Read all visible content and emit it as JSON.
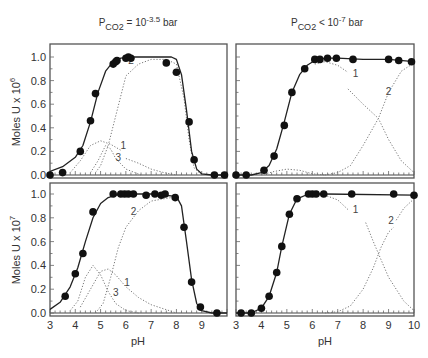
{
  "chart_data": {
    "type": "scatter",
    "titles": {
      "left": {
        "base": "P",
        "sub": "CO2",
        "rest": " = 10",
        "sup": "-3.5",
        "unit": " bar"
      },
      "right": {
        "base": "P",
        "sub": "CO2",
        "rest": " < 10",
        "sup": "-7",
        "unit": " bar"
      }
    },
    "xlabel": "pH",
    "xlim": [
      3,
      10
    ],
    "xticks": [
      3,
      4,
      5,
      6,
      7,
      8,
      9,
      10
    ],
    "ylabels": {
      "top": {
        "text": "Moles U x 10",
        "sup": "6"
      },
      "bottom": {
        "text": "Moles U x 10",
        "sup": "7"
      }
    },
    "ylim": [
      0,
      1.1
    ],
    "yticks": [
      0.0,
      0.2,
      0.4,
      0.6,
      0.8,
      1.0
    ],
    "panels": [
      {
        "id": "top-left",
        "column": "left",
        "row": "top",
        "points": [
          [
            3.0,
            0.0
          ],
          [
            3.5,
            0.02
          ],
          [
            4.2,
            0.2
          ],
          [
            4.6,
            0.46
          ],
          [
            4.8,
            0.69
          ],
          [
            5.5,
            0.94
          ],
          [
            5.6,
            0.96
          ],
          [
            5.65,
            0.97
          ],
          [
            6.0,
            0.99
          ],
          [
            6.1,
            1.0
          ],
          [
            6.2,
            0.99
          ],
          [
            7.6,
            0.95
          ],
          [
            8.0,
            0.87
          ],
          [
            8.5,
            0.45
          ],
          [
            8.7,
            0.13
          ],
          [
            9.5,
            0.0
          ],
          [
            9.9,
            0.0
          ]
        ],
        "fit": [
          [
            3.0,
            0.03
          ],
          [
            3.5,
            0.07
          ],
          [
            4.0,
            0.15
          ],
          [
            4.3,
            0.25
          ],
          [
            4.6,
            0.45
          ],
          [
            4.9,
            0.7
          ],
          [
            5.2,
            0.88
          ],
          [
            5.5,
            0.96
          ],
          [
            5.8,
            0.99
          ],
          [
            6.2,
            1.0
          ],
          [
            7.0,
            1.0
          ],
          [
            7.8,
            1.0
          ],
          [
            8.0,
            0.98
          ],
          [
            8.2,
            0.85
          ],
          [
            8.4,
            0.55
          ],
          [
            8.6,
            0.2
          ],
          [
            8.8,
            0.05
          ],
          [
            9.0,
            0.01
          ],
          [
            9.4,
            0.0
          ],
          [
            10.0,
            0.0
          ]
        ],
        "species": [
          {
            "label": "1",
            "label_at": [
              5.9,
              0.22
            ],
            "points": [
              [
                3.8,
                0.02
              ],
              [
                4.2,
                0.12
              ],
              [
                4.6,
                0.25
              ],
              [
                5.0,
                0.29
              ],
              [
                5.4,
                0.26
              ],
              [
                5.8,
                0.21
              ]
            ]
          },
          {
            "label": "2",
            "label_at": [
              6.2,
              0.94
            ],
            "points": [
              [
                4.8,
                0.02
              ],
              [
                5.0,
                0.08
              ],
              [
                5.3,
                0.25
              ],
              [
                5.6,
                0.5
              ],
              [
                6.0,
                0.84
              ],
              [
                6.5,
                0.94
              ],
              [
                7.0,
                0.98
              ],
              [
                7.6,
                0.98
              ],
              [
                8.0,
                0.94
              ],
              [
                8.3,
                0.65
              ],
              [
                8.5,
                0.3
              ],
              [
                8.7,
                0.06
              ],
              [
                9.0,
                0.0
              ]
            ]
          },
          {
            "label": "3",
            "label_at": [
              5.7,
              0.12
            ],
            "points": [
              [
                4.6,
                0.02
              ],
              [
                4.9,
                0.12
              ],
              [
                5.2,
                0.25
              ],
              [
                5.4,
                0.22
              ],
              [
                5.6,
                0.14
              ],
              [
                6.0,
                0.05
              ],
              [
                6.6,
                0.0
              ]
            ]
          },
          {
            "label": "",
            "label_at": null,
            "points": [
              [
                6.0,
                0.14
              ],
              [
                6.5,
                0.1
              ],
              [
                7.0,
                0.05
              ],
              [
                7.5,
                0.02
              ],
              [
                8.0,
                0.0
              ]
            ]
          }
        ]
      },
      {
        "id": "top-right",
        "column": "right",
        "row": "top",
        "points": [
          [
            3.0,
            0.0
          ],
          [
            3.4,
            0.0
          ],
          [
            4.1,
            0.04
          ],
          [
            4.5,
            0.16
          ],
          [
            4.9,
            0.42
          ],
          [
            5.2,
            0.7
          ],
          [
            5.7,
            0.9
          ],
          [
            6.1,
            0.98
          ],
          [
            6.3,
            0.98
          ],
          [
            6.6,
            0.99
          ],
          [
            6.95,
            0.99
          ],
          [
            7.6,
            0.98
          ],
          [
            9.0,
            0.98
          ],
          [
            9.4,
            0.97
          ],
          [
            9.9,
            0.96
          ]
        ],
        "fit": [
          [
            3.0,
            0.0
          ],
          [
            3.6,
            0.0
          ],
          [
            4.0,
            0.02
          ],
          [
            4.3,
            0.08
          ],
          [
            4.6,
            0.22
          ],
          [
            4.9,
            0.45
          ],
          [
            5.2,
            0.7
          ],
          [
            5.5,
            0.85
          ],
          [
            5.8,
            0.93
          ],
          [
            6.1,
            0.97
          ],
          [
            6.5,
            0.99
          ],
          [
            7.0,
            0.99
          ],
          [
            8.0,
            0.98
          ],
          [
            9.0,
            0.98
          ],
          [
            10.0,
            0.96
          ]
        ],
        "species": [
          {
            "label": "1",
            "label_at": [
              7.7,
              0.83
            ],
            "points": [
              [
                6.1,
                0.94
              ],
              [
                6.5,
                0.96
              ],
              [
                7.0,
                0.93
              ],
              [
                7.4,
                0.87
              ]
            ]
          },
          {
            "label": "",
            "label_at": null,
            "points": [
              [
                4.0,
                0.0
              ],
              [
                4.5,
                0.03
              ],
              [
                5.0,
                0.05
              ],
              [
                5.5,
                0.04
              ],
              [
                6.0,
                0.01
              ],
              [
                6.5,
                0.0
              ]
            ]
          },
          {
            "label": "",
            "label_at": null,
            "points": [
              [
                7.4,
                0.73
              ],
              [
                8.0,
                0.6
              ],
              [
                8.6,
                0.48
              ],
              [
                9.0,
                0.3
              ],
              [
                9.5,
                0.12
              ],
              [
                10.0,
                0.02
              ]
            ]
          },
          {
            "label": "2",
            "label_at": [
              9.0,
              0.68
            ],
            "points": [
              [
                6.5,
                0.0
              ],
              [
                7.0,
                0.02
              ],
              [
                7.5,
                0.08
              ],
              [
                8.0,
                0.25
              ],
              [
                8.6,
                0.48
              ],
              [
                9.0,
                0.7
              ],
              [
                9.5,
                0.88
              ],
              [
                10.0,
                0.95
              ]
            ]
          }
        ]
      },
      {
        "id": "bottom-left",
        "column": "left",
        "row": "bottom",
        "points": [
          [
            3.6,
            0.14
          ],
          [
            4.0,
            0.33
          ],
          [
            4.3,
            0.5
          ],
          [
            4.7,
            0.85
          ],
          [
            5.5,
            1.0
          ],
          [
            5.8,
            1.0
          ],
          [
            5.95,
            1.0
          ],
          [
            6.1,
            1.0
          ],
          [
            6.3,
            1.0
          ],
          [
            6.8,
            0.99
          ],
          [
            7.15,
            1.0
          ],
          [
            7.4,
            0.99
          ],
          [
            7.55,
            1.0
          ],
          [
            7.95,
            0.97
          ],
          [
            8.3,
            0.72
          ],
          [
            8.6,
            0.26
          ],
          [
            8.95,
            0.05
          ],
          [
            9.6,
            0.0
          ]
        ],
        "fit": [
          [
            3.0,
            0.03
          ],
          [
            3.4,
            0.09
          ],
          [
            3.8,
            0.22
          ],
          [
            4.1,
            0.38
          ],
          [
            4.4,
            0.6
          ],
          [
            4.7,
            0.8
          ],
          [
            5.0,
            0.92
          ],
          [
            5.3,
            0.97
          ],
          [
            5.6,
            0.99
          ],
          [
            6.0,
            1.0
          ],
          [
            7.0,
            1.0
          ],
          [
            8.0,
            0.98
          ],
          [
            8.2,
            0.9
          ],
          [
            8.4,
            0.6
          ],
          [
            8.6,
            0.28
          ],
          [
            8.8,
            0.08
          ],
          [
            9.0,
            0.02
          ],
          [
            9.4,
            0.0
          ],
          [
            10.0,
            0.0
          ]
        ],
        "species": [
          {
            "label": "1",
            "label_at": [
              6.05,
              0.23
            ],
            "points": [
              [
                4.2,
                0.05
              ],
              [
                4.6,
                0.2
              ],
              [
                5.0,
                0.35
              ],
              [
                5.3,
                0.37
              ],
              [
                5.6,
                0.32
              ],
              [
                6.0,
                0.22
              ],
              [
                6.5,
                0.13
              ],
              [
                7.0,
                0.07
              ],
              [
                8.0,
                0.0
              ]
            ]
          },
          {
            "label": "2",
            "label_at": [
              6.3,
              0.82
            ],
            "points": [
              [
                4.8,
                0.0
              ],
              [
                5.1,
                0.08
              ],
              [
                5.4,
                0.3
              ],
              [
                5.7,
                0.55
              ],
              [
                6.0,
                0.72
              ],
              [
                6.5,
                0.86
              ],
              [
                7.0,
                0.94
              ],
              [
                7.5,
                0.96
              ],
              [
                7.8,
                0.97
              ]
            ]
          },
          {
            "label": "3",
            "label_at": [
              5.6,
              0.14
            ],
            "points": [
              [
                3.8,
                0.02
              ],
              [
                4.1,
                0.1
              ],
              [
                4.4,
                0.3
              ],
              [
                4.7,
                0.4
              ],
              [
                5.0,
                0.32
              ],
              [
                5.3,
                0.18
              ],
              [
                5.6,
                0.08
              ],
              [
                6.0,
                0.02
              ],
              [
                6.5,
                0.0
              ]
            ]
          }
        ]
      },
      {
        "id": "bottom-right",
        "column": "right",
        "row": "bottom",
        "points": [
          [
            3.2,
            0.0
          ],
          [
            3.6,
            0.0
          ],
          [
            4.0,
            0.04
          ],
          [
            4.3,
            0.14
          ],
          [
            4.6,
            0.34
          ],
          [
            4.8,
            0.56
          ],
          [
            5.1,
            0.83
          ],
          [
            5.4,
            0.96
          ],
          [
            5.85,
            1.0
          ],
          [
            6.0,
            1.0
          ],
          [
            6.15,
            1.0
          ],
          [
            6.45,
            1.0
          ],
          [
            7.55,
            1.0
          ],
          [
            9.2,
            1.0
          ],
          [
            10.0,
            0.99
          ]
        ],
        "fit": [
          [
            3.0,
            0.0
          ],
          [
            3.6,
            0.0
          ],
          [
            4.0,
            0.04
          ],
          [
            4.3,
            0.14
          ],
          [
            4.6,
            0.34
          ],
          [
            4.8,
            0.56
          ],
          [
            5.1,
            0.83
          ],
          [
            5.4,
            0.96
          ],
          [
            5.85,
            1.0
          ],
          [
            6.5,
            1.0
          ],
          [
            10.0,
            0.99
          ]
        ],
        "species": [
          {
            "label": "1",
            "label_at": [
              7.7,
              0.84
            ],
            "points": [
              [
                6.0,
                1.0
              ],
              [
                6.5,
                0.99
              ],
              [
                7.0,
                0.95
              ],
              [
                7.4,
                0.87
              ]
            ]
          },
          {
            "label": "",
            "label_at": null,
            "points": [
              [
                8.1,
                0.76
              ],
              [
                8.4,
                0.6
              ],
              [
                8.7,
                0.45
              ],
              [
                9.0,
                0.3
              ],
              [
                9.3,
                0.2
              ],
              [
                9.6,
                0.1
              ],
              [
                10.0,
                0.02
              ]
            ]
          },
          {
            "label": "2",
            "label_at": [
              9.1,
              0.75
            ],
            "points": [
              [
                6.5,
                0.0
              ],
              [
                7.0,
                0.01
              ],
              [
                7.5,
                0.06
              ],
              [
                8.0,
                0.2
              ],
              [
                8.4,
                0.38
              ],
              [
                8.7,
                0.55
              ],
              [
                9.0,
                0.68
              ],
              [
                9.2,
                0.72
              ]
            ]
          },
          {
            "label": "",
            "label_at": null,
            "points": [
              [
                9.3,
                0.78
              ],
              [
                9.6,
                0.88
              ],
              [
                10.0,
                0.96
              ]
            ]
          }
        ]
      }
    ]
  }
}
